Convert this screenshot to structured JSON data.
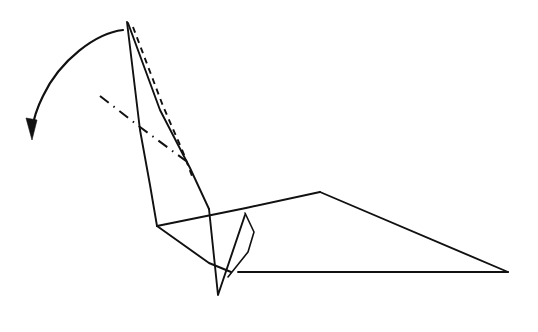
{
  "figure": {
    "background_color": "#ffffff",
    "line_color": "#111111",
    "canvas": {
      "width": 538,
      "height": 332
    },
    "icons": {
      "arrow": "curved-fold-arrow-icon",
      "arrowhead": "arrowhead-icon"
    },
    "annotations": {
      "arrow_label": "",
      "caption": ""
    },
    "strokes": {
      "solid_width": 1.9,
      "dashed_pattern": "6 5",
      "dashdot_pattern": "11 6 1.5 6"
    },
    "elements": [
      {
        "name": "neck-left-edge",
        "type": "polyline",
        "style": "solid",
        "points": "127,22 140,130 150,185 157,226"
      },
      {
        "name": "neck-right-edge",
        "type": "polyline",
        "style": "solid",
        "points": "128,23 160,110 190,168 209,209"
      },
      {
        "name": "neck-fold-crease-dashed",
        "type": "polyline",
        "style": "dashed",
        "points": "133,27 163,106 183,152 192,176"
      },
      {
        "name": "valley-crease-dashdot",
        "type": "polyline",
        "style": "dashdot",
        "points": "100,96 140,127 186,161"
      },
      {
        "name": "body-top-edge",
        "type": "polyline",
        "style": "solid",
        "points": "157,226 246,208 320,192"
      },
      {
        "name": "wing-upper-edge",
        "type": "polyline",
        "style": "solid",
        "points": "320,192 508,272"
      },
      {
        "name": "wing-lower-edge",
        "type": "polyline",
        "style": "solid",
        "points": "508,272 238,272"
      },
      {
        "name": "body-lower-left-edge",
        "type": "polyline",
        "style": "solid",
        "points": "157,226 209,263 231,272"
      },
      {
        "name": "tail-v-shape",
        "type": "polyline",
        "style": "solid",
        "points": "209,209 218,295 245,215"
      },
      {
        "name": "inner-kite-flap",
        "type": "polyline",
        "style": "solid",
        "points": "245,213 254,232 248,252 228,277"
      },
      {
        "name": "curved-fold-arrow",
        "type": "path",
        "style": "arrow",
        "d": "M 123,30 C 96,33 60,60 43,96 C 36,110 33,122 32,130"
      },
      {
        "name": "arrowhead",
        "type": "polygon",
        "style": "filled",
        "points": "26,118 37,120 32,140"
      }
    ]
  }
}
